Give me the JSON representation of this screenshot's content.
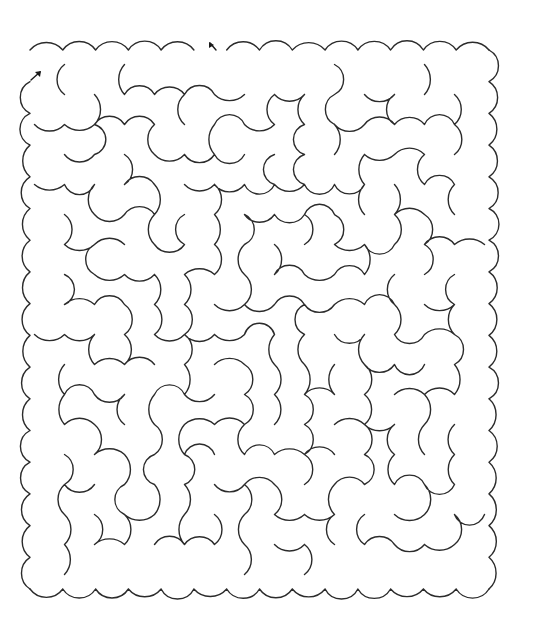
{
  "puzzle": {
    "type": "maze",
    "style": "scalloped-cloud-walls",
    "colors": {
      "background": "#ffffff",
      "wall": "#2b2b2b"
    },
    "bounds": {
      "x0": 22,
      "y0": 42,
      "x1": 497,
      "y1": 597
    },
    "entrance": {
      "label": "start-arrow",
      "x": 33,
      "y": 76,
      "direction": "north-east"
    },
    "exit": {
      "label": "end-arrow",
      "x": 212,
      "y": 46,
      "direction": "north-west"
    },
    "scallop_radius": 15,
    "cell": 30
  }
}
